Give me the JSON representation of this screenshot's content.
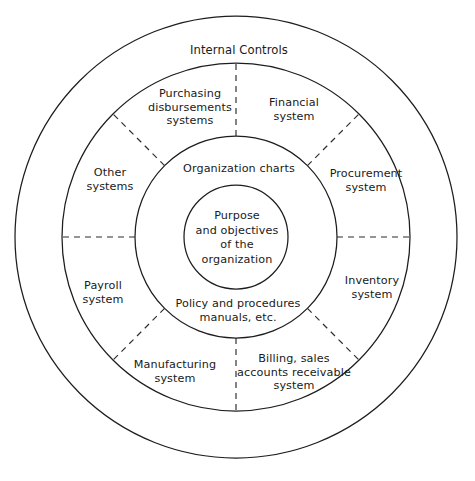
{
  "diagram": {
    "geometry": {
      "center_x": 236,
      "center_y": 237,
      "radii": {
        "outer": 221,
        "second": 174,
        "third": 101,
        "core": 52
      },
      "divider_angles_deg": [
        0,
        45,
        90,
        135,
        180,
        225,
        270,
        315
      ]
    },
    "colors": {
      "background": "#ffffff",
      "stroke": "#1d1d1d",
      "dashed_stroke": "#2a2a2a",
      "text": "#1a1a1a"
    },
    "outer_band": {
      "label": "Internal Controls"
    },
    "systems_ring": [
      {
        "key": "purchasing-disbursements-systems",
        "label": "Purchasing\ndisbursements\nsystems",
        "x": 190,
        "y": 107
      },
      {
        "key": "financial-system",
        "label": "Financial\nsystem",
        "x": 294,
        "y": 110
      },
      {
        "key": "procurement-system",
        "label": "Procurement\nsystem",
        "x": 366,
        "y": 181
      },
      {
        "key": "inventory-system",
        "label": "Inventory\nsystem",
        "x": 372,
        "y": 288
      },
      {
        "key": "billing-sales-accounts-receivable-system",
        "label": "Billing, sales\naccounts receivable\nsystem",
        "x": 294,
        "y": 372
      },
      {
        "key": "manufacturing-system",
        "label": "Manufacturing\nsystem",
        "x": 175,
        "y": 372
      },
      {
        "key": "payroll-system",
        "label": "Payroll\nsystem",
        "x": 103,
        "y": 293
      },
      {
        "key": "other-systems",
        "label": "Other\nsystems",
        "x": 110,
        "y": 180
      }
    ],
    "inner_band": [
      {
        "key": "organization-charts",
        "label": "Organization charts",
        "x": 239,
        "y": 169
      },
      {
        "key": "policy-and-procedures-manuals",
        "label": "Policy and procedures\nmanuals, etc.",
        "x": 238,
        "y": 311
      }
    ],
    "core": {
      "label": "Purpose\nand objectives\nof the\norganization",
      "x": 237,
      "y": 238
    }
  }
}
